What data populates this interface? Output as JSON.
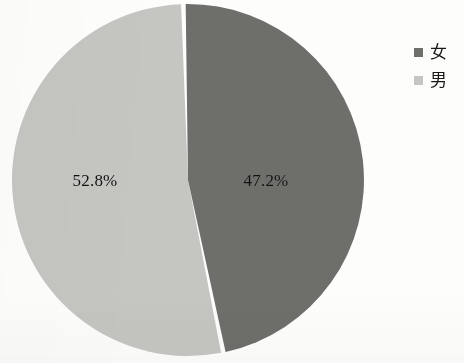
{
  "chart_data": {
    "type": "pie",
    "title": "",
    "categories": [
      "女",
      "男"
    ],
    "values": [
      52.8,
      47.2
    ],
    "value_unit": "%",
    "data_labels": [
      "52.8%",
      "47.2%"
    ],
    "colors": [
      "#c5c5c2",
      "#6e6e6b"
    ],
    "legend": {
      "position": "right",
      "entries": [
        {
          "label": "女",
          "color": "#6e6e6b",
          "value": 47.2
        },
        {
          "label": "男",
          "color": "#c5c5c2",
          "value": 52.8
        }
      ]
    },
    "slice_gap": true,
    "start_angle": -1.5,
    "background_color": "#fdfdfc",
    "label_color": "#13110f"
  },
  "pie": {
    "slice_female": {
      "name": "女",
      "percent_label": "52.8%",
      "color": "#c5c5c2"
    },
    "slice_male": {
      "name": "男",
      "percent_label": "47.2%",
      "color": "#6e6e6b"
    }
  },
  "legend": {
    "items": [
      {
        "label": "女",
        "color": "#6e6e6b"
      },
      {
        "label": "男",
        "color": "#c5c5c2"
      }
    ]
  }
}
